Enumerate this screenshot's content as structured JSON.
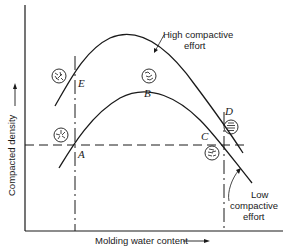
{
  "figure": {
    "type": "compaction-curve-diagram",
    "axes": {
      "y_label": "Compacted density",
      "x_label": "Molding water content",
      "y_arrow": "arrow-right-icon",
      "x_arrow": "arrow-right-icon"
    },
    "curves": [
      {
        "id": "high",
        "label_line1": "High compactive",
        "label_line2": "effort"
      },
      {
        "id": "low",
        "label_line1": "Low",
        "label_line2": "compactive",
        "label_line3": "effort"
      }
    ],
    "points": [
      {
        "id": "E",
        "label": "E",
        "structure": "flocculated",
        "curve": "high"
      },
      {
        "id": "B",
        "label": "B",
        "structure": "flocculated-partial",
        "curve": "low"
      },
      {
        "id": "D",
        "label": "D",
        "structure": "dispersed",
        "curve": "high"
      },
      {
        "id": "A",
        "label": "A",
        "structure": "flocculated",
        "curve": "low"
      },
      {
        "id": "C",
        "label": "C",
        "structure": "dispersed-partial",
        "curve": "low"
      }
    ],
    "colors": {
      "ink": "#1a1a1a",
      "background": "#ffffff"
    }
  }
}
